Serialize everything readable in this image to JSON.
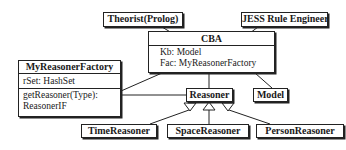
{
  "diagram": {
    "type": "UML class diagram",
    "classes": {
      "theorist": {
        "name": "Theorist(Prolog)"
      },
      "jess": {
        "name": "JESS Rule Engineer"
      },
      "cba": {
        "name": "CBA",
        "attributes": [
          "Kb: Model",
          "Fac: MyReasonerFactory"
        ]
      },
      "factory": {
        "name": "MyReasonerFactory",
        "attributes": [
          "rSet: HashSet"
        ],
        "methods": [
          "getReasoner(Type):",
          "ReasonerIF"
        ]
      },
      "reasoner": {
        "name": "Reasoner"
      },
      "model": {
        "name": "Model"
      },
      "time": {
        "name": "TimeReasoner"
      },
      "space": {
        "name": "SpaceReasoner"
      },
      "person": {
        "name": "PersonReasoner"
      }
    },
    "relations": [
      {
        "from": "Theorist(Prolog)",
        "to": "CBA",
        "kind": "association"
      },
      {
        "from": "JESS Rule Engineer",
        "to": "CBA",
        "kind": "association"
      },
      {
        "from": "CBA",
        "to": "MyReasonerFactory",
        "kind": "association"
      },
      {
        "from": "CBA",
        "to": "Reasoner",
        "kind": "association"
      },
      {
        "from": "CBA",
        "to": "Model",
        "kind": "association"
      },
      {
        "from": "MyReasonerFactory",
        "to": "Reasoner",
        "kind": "association"
      },
      {
        "from": "TimeReasoner",
        "to": "Reasoner",
        "kind": "generalization"
      },
      {
        "from": "SpaceReasoner",
        "to": "Reasoner",
        "kind": "generalization"
      },
      {
        "from": "PersonReasoner",
        "to": "Reasoner",
        "kind": "generalization"
      }
    ]
  }
}
